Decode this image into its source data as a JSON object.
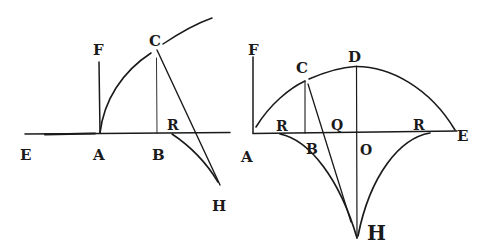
{
  "figure": {
    "ink_color": "#1a1a1a",
    "background": "#ffffff",
    "left_figure": {
      "labels": {
        "E": "E",
        "A": "A",
        "B": "B",
        "F": "F",
        "C": "C",
        "R": "R",
        "H": "H"
      }
    },
    "right_figure": {
      "labels": {
        "F": "F",
        "C": "C",
        "D": "D",
        "A": "A",
        "R1": "R",
        "B": "B",
        "Q": "Q",
        "O": "O",
        "R2": "R",
        "E": "E",
        "H": "H"
      }
    }
  }
}
